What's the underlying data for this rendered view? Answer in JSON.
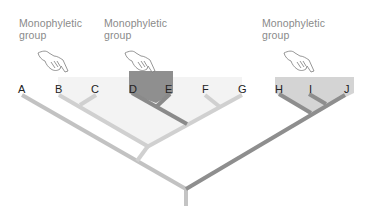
{
  "diagram": {
    "type": "phylogenetic-tree",
    "title": "",
    "captions": [
      {
        "id": "cap1",
        "line1": "Monophyletic",
        "line2": "group",
        "x": 19,
        "y": 17,
        "target": "B-G clade"
      },
      {
        "id": "cap2",
        "line1": "Monophyletic",
        "line2": "group",
        "x": 104,
        "y": 17,
        "target": "D-E clade"
      },
      {
        "id": "cap3",
        "line1": "Monophyletic",
        "line2": "group",
        "x": 262,
        "y": 17,
        "target": "H-J clade"
      }
    ],
    "taxa": [
      {
        "label": "A",
        "x": 22
      },
      {
        "label": "B",
        "x": 60
      },
      {
        "label": "C",
        "x": 96
      },
      {
        "label": "D",
        "x": 133
      },
      {
        "label": "E",
        "x": 169
      },
      {
        "label": "F",
        "x": 206
      },
      {
        "label": "G",
        "x": 242
      },
      {
        "label": "H",
        "x": 279
      },
      {
        "label": "I",
        "x": 311
      },
      {
        "label": "J",
        "x": 348
      }
    ],
    "clades": [
      {
        "name": "B-G",
        "members": [
          "B",
          "C",
          "D",
          "E",
          "F",
          "G"
        ],
        "shade": "#f3f3f3"
      },
      {
        "name": "D-E",
        "members": [
          "D",
          "E"
        ],
        "shade": "#8e8e8e"
      },
      {
        "name": "H-J",
        "members": [
          "H",
          "I",
          "J"
        ],
        "shade": "#cfcfcf"
      }
    ],
    "colors": {
      "caption_text": "#8a8a8a",
      "taxon_text": "#222222",
      "branch_light": "#cfcfcf",
      "branch_mid": "#b9b9b9",
      "branch_dark": "#8c8c8c",
      "shade_light": "#f3f3f3",
      "shade_mid": "#d3d3d3",
      "shade_dark": "#8e8e8e"
    },
    "icons": {
      "pointer": "pointing-hand-icon"
    }
  }
}
